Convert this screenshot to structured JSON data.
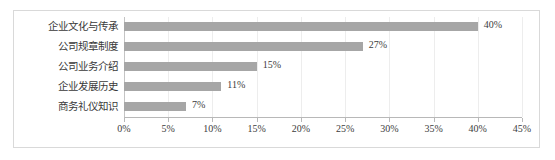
{
  "chart_data": {
    "type": "bar",
    "orientation": "horizontal",
    "title": "",
    "xlabel": "",
    "ylabel": "",
    "categories": [
      "企业文化与传承",
      "公司规章制度",
      "公司业务介绍",
      "企业发展历史",
      "商务礼仪知识"
    ],
    "values": [
      40,
      27,
      15,
      11,
      7
    ],
    "data_labels": [
      "40%",
      "27%",
      "15%",
      "11%",
      "7%"
    ],
    "xlim": [
      0,
      45
    ],
    "xtick_values": [
      0,
      5,
      10,
      15,
      20,
      25,
      30,
      35,
      40,
      45
    ],
    "xtick_labels": [
      "0%",
      "5%",
      "10%",
      "15%",
      "20%",
      "25%",
      "30%",
      "35%",
      "40%",
      "45%"
    ],
    "grid": true,
    "legend": null,
    "series_color": "#a6a6a6",
    "gridline_color": "#ededed",
    "axis_color": "#b8b8b8",
    "border_color": "#d9d9d9",
    "text_color": "#3c3c3c"
  }
}
